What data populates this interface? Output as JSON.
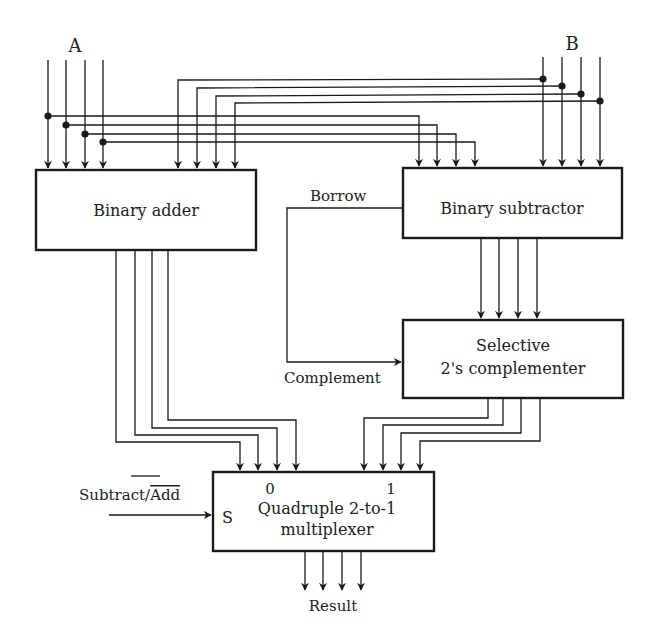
{
  "diagram": {
    "title": "",
    "inputs": {
      "a": {
        "label": "A",
        "bits": 4
      },
      "b": {
        "label": "B",
        "bits": 4
      }
    },
    "blocks": {
      "adder": {
        "label": "Binary adder"
      },
      "subtractor": {
        "label": "Binary subtractor"
      },
      "complementer": {
        "line1": "Selective",
        "line2": "2's complementer"
      },
      "mux": {
        "line1": "Quadruple 2-to-1",
        "line2": "multiplexer",
        "select_pin": "S",
        "input0": "0",
        "input1": "1"
      }
    },
    "signals": {
      "borrow": "Borrow",
      "complement": "Complement",
      "control_main": "Subtract/",
      "control_overbar": "Add",
      "result": "Result"
    },
    "colors": {
      "ink": "#1a1a1a",
      "background": "#ffffff"
    }
  }
}
